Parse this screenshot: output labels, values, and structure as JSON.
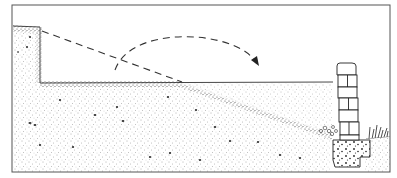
{
  "diagram": {
    "type": "illustration",
    "colors": {
      "ink": "#2a2a2a",
      "soil_stipple": "#555555",
      "paper": "#ffffff",
      "frame": "#444444"
    },
    "elements": [
      {
        "name": "frame",
        "role": "border"
      },
      {
        "name": "cut-bank",
        "role": "original high ground on left, vertical cut face"
      },
      {
        "name": "level-grade-line",
        "role": "new level surface after fill"
      },
      {
        "name": "original-slope-dashed-line",
        "role": "original ground slope (removed)"
      },
      {
        "name": "soil-mass",
        "role": "stippled earth"
      },
      {
        "name": "fill-wedge",
        "role": "fill placed behind wall"
      },
      {
        "name": "movement-arrow",
        "role": "dashed curved arrow: soil moved from cut to fill"
      },
      {
        "name": "retaining-wall",
        "role": "stacked block wall",
        "blocks": 6
      },
      {
        "name": "wall-footing",
        "role": "concrete footing with aggregate"
      },
      {
        "name": "grass-tuft",
        "role": "vegetation at toe"
      }
    ]
  }
}
